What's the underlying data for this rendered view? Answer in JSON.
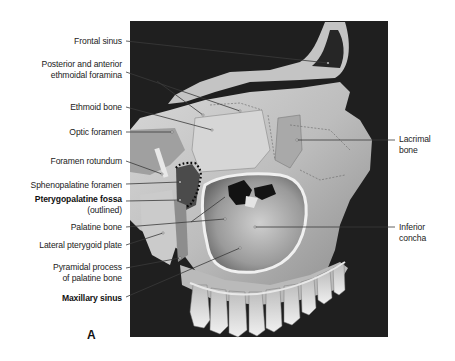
{
  "figure": {
    "panel_letter": "A",
    "labels_left": [
      {
        "id": "frontal-sinus",
        "lines": [
          "Frontal sinus"
        ],
        "bold": false
      },
      {
        "id": "ethmoidal-foramina",
        "lines": [
          "Posterior and anterior",
          "ethmoidal foramina"
        ],
        "bold": false
      },
      {
        "id": "ethmoid-bone",
        "lines": [
          "Ethmoid bone"
        ],
        "bold": false
      },
      {
        "id": "optic-foramen",
        "lines": [
          "Optic foramen"
        ],
        "bold": false
      },
      {
        "id": "foramen-rotundum",
        "lines": [
          "Foramen rotundum"
        ],
        "bold": false
      },
      {
        "id": "sphenopalatine-foramen",
        "lines": [
          "Sphenopalatine foramen"
        ],
        "bold": false
      },
      {
        "id": "pterygopalatine-fossa",
        "lines": [
          "Pterygopalatine fossa",
          "(outlined)"
        ],
        "bold": true
      },
      {
        "id": "palatine-bone",
        "lines": [
          "Palatine bone"
        ],
        "bold": false
      },
      {
        "id": "lateral-pterygoid-plate",
        "lines": [
          "Lateral pterygoid plate"
        ],
        "bold": false
      },
      {
        "id": "pyramidal-process",
        "lines": [
          "Pyramidal process",
          "of palatine bone"
        ],
        "bold": false
      },
      {
        "id": "maxillary-sinus",
        "lines": [
          "Maxillary sinus"
        ],
        "bold": true
      }
    ],
    "labels_right": [
      {
        "id": "lacrimal-bone",
        "lines": [
          "Lacrimal",
          "bone"
        ],
        "bold": false
      },
      {
        "id": "inferior-concha",
        "lines": [
          "Inferior",
          "concha"
        ],
        "bold": false
      }
    ],
    "colors": {
      "background": "#ffffff",
      "photo_bg": "#1e1e1e",
      "bone_light": "#e6e6e6",
      "bone_mid": "#b4b4b4",
      "bone_dark": "#6e6e6e",
      "leader_line": "#3a3a3a",
      "text": "#222222"
    }
  }
}
